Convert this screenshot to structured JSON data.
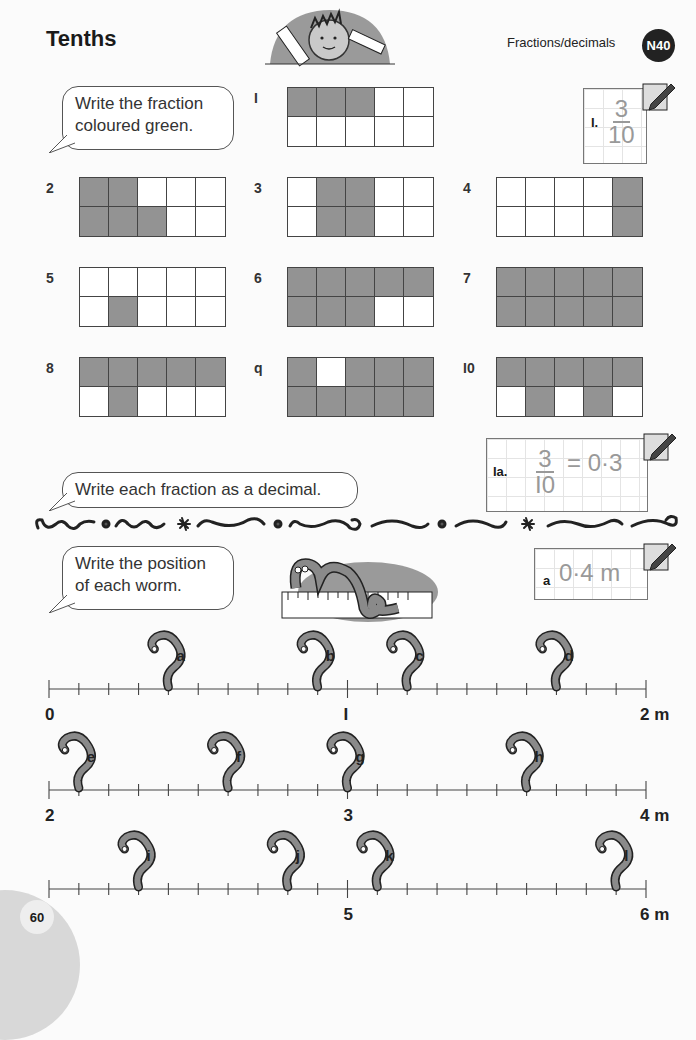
{
  "header": {
    "title": "Tenths",
    "topic": "Fractions/decimals",
    "badge": "N40"
  },
  "section1": {
    "instruction_line1": "Write the fraction",
    "instruction_line2": "coloured green.",
    "example": {
      "label": "I.",
      "numerator": "3",
      "denominator": "10"
    },
    "questions": [
      {
        "num": "I",
        "shaded": [
          1,
          1,
          1,
          0,
          0,
          0,
          0,
          0,
          0,
          0
        ]
      },
      {
        "num": "2",
        "shaded": [
          1,
          1,
          0,
          0,
          0,
          1,
          1,
          1,
          0,
          0
        ]
      },
      {
        "num": "3",
        "shaded": [
          0,
          1,
          1,
          0,
          0,
          0,
          1,
          1,
          0,
          0
        ]
      },
      {
        "num": "4",
        "shaded": [
          0,
          0,
          0,
          0,
          1,
          0,
          0,
          0,
          0,
          1
        ]
      },
      {
        "num": "5",
        "shaded": [
          0,
          0,
          0,
          0,
          0,
          0,
          1,
          0,
          0,
          0
        ]
      },
      {
        "num": "6",
        "shaded": [
          1,
          1,
          1,
          1,
          1,
          1,
          1,
          1,
          0,
          0
        ]
      },
      {
        "num": "7",
        "shaded": [
          1,
          1,
          1,
          1,
          1,
          1,
          1,
          1,
          1,
          1
        ]
      },
      {
        "num": "8",
        "shaded": [
          1,
          1,
          1,
          1,
          1,
          0,
          1,
          0,
          0,
          0
        ]
      },
      {
        "num": "q",
        "shaded": [
          1,
          0,
          1,
          1,
          1,
          1,
          1,
          1,
          1,
          1
        ]
      },
      {
        "num": "I0",
        "shaded": [
          1,
          1,
          1,
          1,
          1,
          0,
          1,
          0,
          1,
          0
        ]
      }
    ]
  },
  "section2": {
    "instruction": "Write each fraction as a decimal.",
    "example": {
      "label": "Ia.",
      "numerator": "3",
      "denominator": "I0",
      "equals": "= 0·3"
    }
  },
  "section3": {
    "instruction_line1": "Write the position",
    "instruction_line2": "of each worm.",
    "example": {
      "label": "a",
      "answer": "0·4 m"
    },
    "number_lines": [
      {
        "start": "0",
        "mid": "I",
        "end": "2 m",
        "worms": [
          {
            "label": "a",
            "tick": 4
          },
          {
            "label": "b",
            "tick": 9
          },
          {
            "label": "c",
            "tick": 12
          },
          {
            "label": "d",
            "tick": 17
          }
        ]
      },
      {
        "start": "2",
        "mid": "3",
        "end": "4 m",
        "worms": [
          {
            "label": "e",
            "tick": 1
          },
          {
            "label": "f",
            "tick": 6
          },
          {
            "label": "g",
            "tick": 10
          },
          {
            "label": "h",
            "tick": 16
          }
        ]
      },
      {
        "start": "4",
        "mid": "5",
        "end": "6 m",
        "worms": [
          {
            "label": "i",
            "tick": 3
          },
          {
            "label": "j",
            "tick": 8
          },
          {
            "label": "k",
            "tick": 11
          },
          {
            "label": "l",
            "tick": 19
          }
        ]
      }
    ]
  },
  "footer": {
    "page_number": "60"
  },
  "colors": {
    "shaded": "#939393",
    "answer_gray": "#999999",
    "badge": "#222222"
  }
}
